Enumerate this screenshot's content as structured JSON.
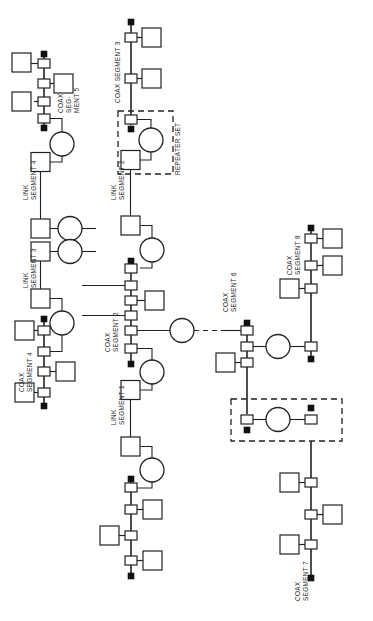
{
  "diagram": {
    "orientation": "rotated-90-ccw",
    "background_color": "#ffffff",
    "line_color": "#222222",
    "terminator_color": "#111111",
    "labels": {
      "coax_segment_1": "COAX SEGMENT 1",
      "coax_segment_2": "COAX\nSEGMENT 2",
      "coax_segment_2_l1": "COAX",
      "coax_segment_2_l2": "SEGMENT 2",
      "coax_segment_3": "COAX SEGMENT 3",
      "coax_segment_4_l1": "COAX",
      "coax_segment_4_l2": "SEGMENT 4",
      "coax_segment_5_l1": "COAX",
      "coax_segment_5_l2": "SEG-",
      "coax_segment_5_l3": "MENT 5",
      "coax_segment_6_l1": "COAX",
      "coax_segment_6_l2": "SEGMENT 6",
      "coax_segment_7_l1": "COAX",
      "coax_segment_7_l2": "SEGMENT 7",
      "coax_segment_8_l1": "COAX",
      "coax_segment_8_l2": "SEGMENT 8",
      "link_segment_1_l1": "LINK",
      "link_segment_1_l2": "SEGMENT 1",
      "link_segment_2_l1": "LINK",
      "link_segment_2_l2": "SEGMENT 2",
      "link_segment_3_l1": "LINK",
      "link_segment_3_l2": "SEGMENT 3",
      "link_segment_4_l1": "LINK",
      "link_segment_4_l2": "SEGMENT 4",
      "repeater_set": "REPEATER SET"
    },
    "legend_semantics": {
      "dte_box": "DTE station (open square)",
      "mau_tap": "MAU / transceiver tap on coax",
      "terminator": "Coax cable terminator (filled square)",
      "repeater_circle": "Repeater unit (circle)",
      "repeater_set_frame": "Repeater set boundary (dashed)"
    },
    "segments": [
      {
        "id": "coax-segment-5",
        "name": "COAX SEGMENT 5",
        "type": "coax",
        "tap_count": 4,
        "dte_count": 3,
        "repeater_count": 1
      },
      {
        "id": "coax-segment-3",
        "name": "COAX SEGMENT 3",
        "type": "coax",
        "tap_count": 3,
        "dte_count": 2,
        "repeater_count": 1
      },
      {
        "id": "coax-segment-2",
        "name": "COAX SEGMENT 2",
        "type": "coax",
        "tap_count": 6,
        "dte_count": 1,
        "repeater_count": 4
      },
      {
        "id": "coax-segment-4",
        "name": "COAX SEGMENT 4",
        "type": "coax",
        "tap_count": 4,
        "dte_count": 3,
        "repeater_count": 1
      },
      {
        "id": "coax-segment-1",
        "name": "COAX SEGMENT 1",
        "type": "coax",
        "tap_count": 4,
        "dte_count": 3,
        "repeater_count": 1
      },
      {
        "id": "coax-segment-6",
        "name": "COAX SEGMENT 6",
        "type": "coax",
        "tap_count": 4,
        "dte_count": 1,
        "repeater_count": 2
      },
      {
        "id": "coax-segment-8",
        "name": "COAX SEGMENT 8",
        "type": "coax",
        "tap_count": 4,
        "dte_count": 3,
        "repeater_count": 1
      },
      {
        "id": "coax-segment-7",
        "name": "COAX SEGMENT 7",
        "type": "coax",
        "tap_count": 3,
        "dte_count": 3,
        "repeater_count": 0
      },
      {
        "id": "link-segment-1",
        "name": "LINK SEGMENT 1",
        "type": "link"
      },
      {
        "id": "link-segment-2",
        "name": "LINK SEGMENT 2",
        "type": "link"
      },
      {
        "id": "link-segment-3",
        "name": "LINK SEGMENT 3",
        "type": "link"
      },
      {
        "id": "link-segment-4",
        "name": "LINK SEGMENT 4",
        "type": "link"
      }
    ],
    "repeater_sets": [
      {
        "id": "repeater-set-upper",
        "label": "REPEATER SET"
      },
      {
        "id": "repeater-set-lower",
        "label": ""
      }
    ]
  }
}
